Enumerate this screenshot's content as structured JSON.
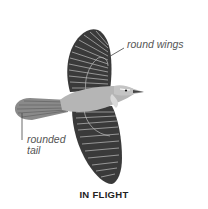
{
  "illustration": {
    "subject": "bird-in-flight",
    "colors": {
      "wing_dark": "#3a3a3a",
      "feather_line": "#bdbdbd",
      "body": "#b5b5b5",
      "underside": "#d9d9d9",
      "background": "#ffffff",
      "label_text": "#555555",
      "caption_text": "#222222"
    }
  },
  "annotations": {
    "wings": "round wings",
    "tail_line1": "rounded",
    "tail_line2": "tail"
  },
  "caption": "IN FLIGHT"
}
